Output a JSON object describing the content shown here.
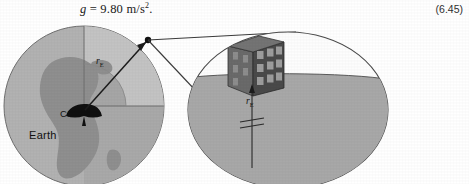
{
  "equation": {
    "symbol": "g",
    "relation": "=",
    "value": "9.80",
    "units": "m/s",
    "exponent": "2",
    "terminator": ".",
    "full_text": "g = 9.80 m/s2.",
    "number": "(6.45)"
  },
  "figure": {
    "caption_present": false,
    "earth": {
      "label": "Earth",
      "center_of_mass_label": "CM",
      "radius_label": "r",
      "radius_subscript": "E",
      "body_color": "#b2b2b2",
      "continent_color": "#8f8f8f",
      "sector_light_color": "#c0c0c0",
      "sector_dark_color": "#a3a3a3",
      "outline_color": "#6b6b6b",
      "cm_wedge_color": "#111111"
    },
    "inset": {
      "sky_color": "#fdfdfd",
      "ground_color": "#a8a8a8",
      "outline_color": "#4a4a4a",
      "building_front_color": "#4a4a4a",
      "building_side_color": "#6a6a6a",
      "building_top_color": "#747474",
      "window_color": "#9d9d9d",
      "radius_label": "r",
      "radius_subscript": "E",
      "break_symbol": "double-slash-break",
      "building_window_rows": 3,
      "building_window_cols": 3
    },
    "connector_color": "#3a3a3a",
    "surface_point_color": "#111111"
  }
}
